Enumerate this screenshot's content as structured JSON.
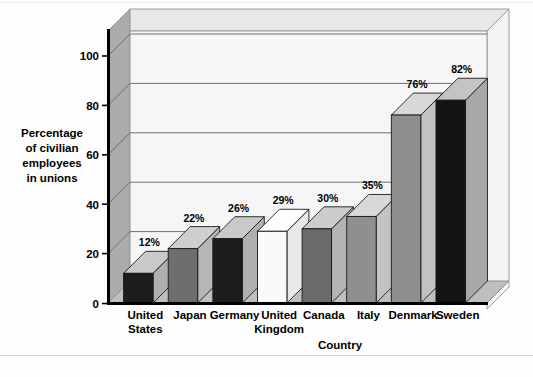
{
  "chart_data": {
    "type": "bar",
    "title": "",
    "subtitle": "",
    "xlabel": "Country",
    "ylabel": "Percentage of civilian employees in unions",
    "ylabel_lines": [
      "Percentage",
      "of civilian",
      "employees",
      "in unions"
    ],
    "categories": [
      "United States",
      "Japan",
      "Germany",
      "United Kingdom",
      "Canada",
      "Italy",
      "Denmark",
      "Sweden"
    ],
    "category_lines": [
      [
        "United",
        "States"
      ],
      [
        "Japan"
      ],
      [
        "Germany"
      ],
      [
        "United",
        "Kingdom"
      ],
      [
        "Canada"
      ],
      [
        "Italy"
      ],
      [
        "Denmark"
      ],
      [
        "Sweden"
      ]
    ],
    "values": [
      12,
      22,
      26,
      29,
      30,
      35,
      76,
      82
    ],
    "data_labels": [
      "12%",
      "22%",
      "26%",
      "29%",
      "30%",
      "35%",
      "76%",
      "82%"
    ],
    "ytick_labels": [
      "0",
      "20",
      "40",
      "60",
      "80",
      "100"
    ],
    "ytick_values": [
      0,
      20,
      40,
      60,
      80,
      100
    ],
    "ylim": [
      0,
      110
    ],
    "grid": true,
    "grid_axis": "y",
    "legend": "none",
    "style": "3d-bar",
    "bar_face_colors": [
      "#1d1d1d",
      "#6e6e6e",
      "#1d1d1d",
      "#fafafa",
      "#6a6a6a",
      "#8f8f8f",
      "#8f8f8f",
      "#141414"
    ],
    "bar_top_colors": [
      "#c9c9c9",
      "#cfcfcf",
      "#c9c9c9",
      "#fdfdfd",
      "#cccccc",
      "#d8d8d8",
      "#d8d8d8",
      "#c4c4c4"
    ],
    "bar_side_colors": [
      "#b0b0b0",
      "#b6b6b6",
      "#b0b0b0",
      "#e9e9e9",
      "#b3b3b3",
      "#c2c2c2",
      "#c2c2c2",
      "#a8a8a8"
    ],
    "palette": {
      "plot_back_wall": "#f6f6f6",
      "plot_left_wall": "#a9a9a9",
      "plot_floor": "#bdbdbd",
      "plot_top_face": "#e4e4e4",
      "gridline": "#7a7a7a",
      "axis_line": "#000000",
      "background": "#fdfdfd"
    }
  }
}
